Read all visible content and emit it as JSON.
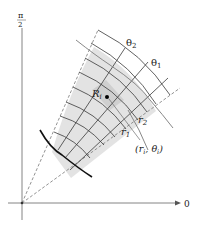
{
  "figure": {
    "axes": {
      "polar_axis_label": "0",
      "vertical_axis_label_num": "π",
      "vertical_axis_label_den": "2"
    },
    "labels": {
      "theta2": "θ",
      "theta2_sub": "2",
      "theta1": "θ",
      "theta1_sub": "1",
      "r2": "r",
      "r2_sub": "2",
      "r1": "r",
      "r1_sub": "1",
      "region": "R",
      "region_sub": "i",
      "point": "(r",
      "point_sub1": "i",
      "point_mid": ", θ",
      "point_sub2": "i",
      "point_end": ")"
    },
    "colors": {
      "shade": "#e2e2e2",
      "shade_dark": "#d2d2d2",
      "grid": "#3a3a3a",
      "axis": "#777777",
      "curve": "#888888",
      "boundary": "#111111"
    }
  }
}
